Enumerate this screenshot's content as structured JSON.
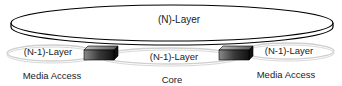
{
  "diagram": {
    "top_layer": {
      "label": "(N)-Layer"
    },
    "sub_layers": [
      {
        "id": "left",
        "label": "(N-1)-Layer",
        "domain": "Media Access"
      },
      {
        "id": "center",
        "label": "(N-1)-Layer",
        "domain": "Core"
      },
      {
        "id": "right",
        "label": "(N-1)-Layer",
        "domain": "Media Access"
      }
    ],
    "connectors": [
      {
        "id": "left-box",
        "between": [
          "left",
          "center"
        ]
      },
      {
        "id": "right-box",
        "between": [
          "center",
          "right"
        ]
      }
    ],
    "colors": {
      "outline": "#000000",
      "sub_layer_outline": "#c8c8c8",
      "box_dark": "#1a1a1a",
      "box_light": "#9a9a9a"
    }
  }
}
